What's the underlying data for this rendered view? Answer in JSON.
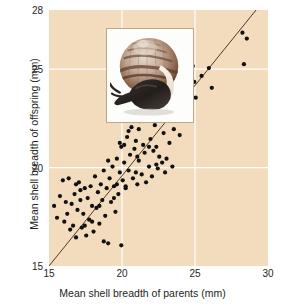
{
  "figure": {
    "background_color": "#ffffff",
    "plot_background_color": "#f2dcbd",
    "gridline_color": "#ffffff",
    "point_color": "#111111",
    "line_color": "#4a3b28"
  },
  "inset": {
    "name": "snail-photograph",
    "caption": "",
    "border_color": "#b9a88c",
    "mat_color": "#fdfdfb"
  },
  "chart_data": {
    "type": "scatter",
    "title": "",
    "subtitle": "",
    "xlabel": "Mean shell breadth of parents (mm)",
    "ylabel": "Mean shell breadth of offspring (mm)",
    "xlim": [
      15,
      30
    ],
    "ylim": [
      15,
      28
    ],
    "xticks": [
      15,
      20,
      25,
      30
    ],
    "yticks": [
      15,
      20,
      25,
      28
    ],
    "xtick_labels": [
      "15",
      "20",
      "25",
      "30"
    ],
    "ytick_labels": [
      "15",
      "20",
      "25",
      "28"
    ],
    "grid": true,
    "grid_axis": "both",
    "legend": null,
    "annotations": [],
    "trendline": {
      "type": "line",
      "label": "",
      "x": [
        15.0,
        30.0
      ],
      "y": [
        15.0,
        28.75
      ]
    },
    "series": [
      {
        "name": "Snail families",
        "marker": "circle",
        "color": "#111111",
        "points": [
          [
            15.35,
            18.05
          ],
          [
            15.55,
            17.45
          ],
          [
            15.75,
            18.55
          ],
          [
            15.95,
            19.35
          ],
          [
            16.05,
            17.25
          ],
          [
            16.15,
            18.25
          ],
          [
            16.35,
            19.45
          ],
          [
            16.45,
            16.85
          ],
          [
            16.55,
            18.15
          ],
          [
            16.65,
            17.05
          ],
          [
            16.75,
            18.65
          ],
          [
            16.85,
            16.45
          ],
          [
            16.95,
            17.85
          ],
          [
            17.05,
            19.25
          ],
          [
            17.15,
            18.35
          ],
          [
            17.25,
            16.95
          ],
          [
            17.35,
            17.65
          ],
          [
            17.45,
            18.95
          ],
          [
            17.55,
            16.55
          ],
          [
            17.65,
            18.45
          ],
          [
            17.75,
            17.35
          ],
          [
            17.85,
            19.05
          ],
          [
            17.95,
            18.05
          ],
          [
            18.05,
            16.75
          ],
          [
            18.15,
            19.55
          ],
          [
            18.25,
            17.95
          ],
          [
            18.35,
            18.75
          ],
          [
            18.45,
            17.15
          ],
          [
            18.55,
            19.15
          ],
          [
            18.65,
            18.35
          ],
          [
            18.75,
            19.85
          ],
          [
            18.85,
            17.55
          ],
          [
            18.95,
            18.95
          ],
          [
            19.05,
            16.15
          ],
          [
            19.15,
            19.45
          ],
          [
            19.25,
            18.25
          ],
          [
            19.35,
            20.05
          ],
          [
            19.45,
            19.05
          ],
          [
            19.55,
            17.75
          ],
          [
            19.65,
            20.45
          ],
          [
            19.75,
            18.65
          ],
          [
            19.85,
            19.75
          ],
          [
            19.95,
            21.05
          ],
          [
            20.05,
            19.35
          ],
          [
            20.15,
            20.25
          ],
          [
            20.25,
            18.95
          ],
          [
            20.35,
            21.55
          ],
          [
            20.45,
            19.85
          ],
          [
            20.55,
            20.65
          ],
          [
            20.65,
            22.05
          ],
          [
            20.75,
            19.45
          ],
          [
            20.85,
            20.95
          ],
          [
            20.95,
            21.35
          ],
          [
            21.05,
            19.15
          ],
          [
            21.15,
            20.35
          ],
          [
            21.25,
            22.35
          ],
          [
            21.35,
            19.65
          ],
          [
            21.45,
            21.15
          ],
          [
            21.55,
            20.75
          ],
          [
            21.65,
            19.25
          ],
          [
            21.75,
            22.65
          ],
          [
            21.85,
            20.05
          ],
          [
            21.95,
            21.45
          ],
          [
            22.05,
            19.55
          ],
          [
            22.15,
            20.85
          ],
          [
            22.25,
            22.15
          ],
          [
            22.35,
            21.05
          ],
          [
            22.45,
            19.95
          ],
          [
            22.55,
            20.55
          ],
          [
            22.65,
            22.85
          ],
          [
            22.75,
            20.25
          ],
          [
            22.85,
            21.75
          ],
          [
            22.95,
            19.75
          ],
          [
            23.05,
            20.45
          ],
          [
            23.15,
            22.45
          ],
          [
            23.25,
            21.25
          ],
          [
            23.35,
            23.05
          ],
          [
            23.55,
            21.95
          ],
          [
            23.75,
            22.55
          ],
          [
            23.95,
            21.65
          ],
          [
            24.15,
            23.35
          ],
          [
            24.25,
            26.85
          ],
          [
            24.35,
            24.25
          ],
          [
            24.45,
            25.55
          ],
          [
            24.55,
            23.85
          ],
          [
            24.65,
            24.45
          ],
          [
            24.75,
            24.15
          ],
          [
            24.85,
            25.15
          ],
          [
            24.95,
            24.35
          ],
          [
            25.05,
            23.55
          ],
          [
            25.45,
            24.65
          ],
          [
            25.95,
            25.05
          ],
          [
            26.15,
            24.05
          ],
          [
            28.25,
            26.85
          ],
          [
            28.35,
            25.25
          ],
          [
            28.55,
            26.55
          ],
          [
            19.05,
            20.35
          ],
          [
            19.85,
            21.25
          ],
          [
            20.45,
            21.85
          ],
          [
            21.15,
            21.95
          ],
          [
            21.85,
            21.05
          ],
          [
            20.95,
            19.75
          ],
          [
            20.25,
            19.05
          ],
          [
            19.45,
            18.45
          ],
          [
            18.45,
            18.05
          ],
          [
            17.95,
            17.25
          ],
          [
            17.15,
            18.85
          ],
          [
            16.25,
            17.65
          ],
          [
            20.75,
            22.45
          ],
          [
            21.45,
            22.75
          ],
          [
            22.15,
            23.25
          ],
          [
            19.65,
            19.15
          ],
          [
            20.15,
            21.15
          ],
          [
            21.05,
            20.55
          ],
          [
            22.35,
            20.15
          ],
          [
            23.45,
            20.05
          ],
          [
            18.75,
            16.25
          ],
          [
            19.95,
            16.05
          ],
          [
            17.45,
            17.05
          ],
          [
            16.85,
            19.15
          ]
        ]
      }
    ]
  }
}
